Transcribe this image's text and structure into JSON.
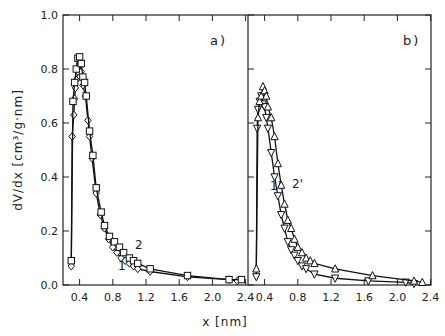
{
  "chart_data": [
    {
      "panel": "a)",
      "type": "line",
      "title": "",
      "xlabel": "x [nm]",
      "ylabel": "dV/dx [cm3/g·nm]",
      "xlim": [
        0.2,
        2.43
      ],
      "ylim": [
        0.0,
        1.0
      ],
      "xticks": [
        "0.4",
        "0.8",
        "1.2",
        "1.6",
        "2.0",
        "2.4"
      ],
      "yticks": [
        "0.0",
        "0.2",
        "0.4",
        "0.6",
        "0.8",
        "1.0"
      ],
      "grid": false,
      "series": [
        {
          "name": "1",
          "marker": "diamond",
          "x": [
            0.3,
            0.31,
            0.33,
            0.34,
            0.35,
            0.36,
            0.38,
            0.4,
            0.42,
            0.44,
            0.47,
            0.5,
            0.52,
            0.55,
            0.6,
            0.65,
            0.7,
            0.75,
            0.8,
            0.85,
            0.9,
            0.95,
            1.0,
            1.05,
            1.1,
            1.25,
            1.7,
            2.2,
            2.3
          ],
          "y": [
            0.07,
            0.55,
            0.63,
            0.69,
            0.73,
            0.76,
            0.79,
            0.82,
            0.79,
            0.74,
            0.7,
            0.61,
            0.55,
            0.47,
            0.34,
            0.26,
            0.21,
            0.17,
            0.14,
            0.12,
            0.1,
            0.09,
            0.08,
            0.07,
            0.06,
            0.05,
            0.03,
            0.02,
            0.015
          ]
        },
        {
          "name": "2",
          "marker": "square",
          "x": [
            0.3,
            0.32,
            0.34,
            0.36,
            0.38,
            0.4,
            0.42,
            0.44,
            0.46,
            0.48,
            0.52,
            0.56,
            0.6,
            0.66,
            0.7,
            0.76,
            0.82,
            0.88,
            0.93,
            1.0,
            1.05,
            1.1,
            1.25,
            1.7,
            2.2,
            2.35
          ],
          "y": [
            0.09,
            0.68,
            0.75,
            0.8,
            0.84,
            0.845,
            0.82,
            0.77,
            0.75,
            0.7,
            0.57,
            0.48,
            0.36,
            0.27,
            0.22,
            0.18,
            0.16,
            0.14,
            0.12,
            0.1,
            0.09,
            0.08,
            0.06,
            0.035,
            0.02,
            0.02
          ]
        }
      ],
      "annotations": [
        {
          "text": "1",
          "x": 0.93,
          "y": 0.03
        },
        {
          "text": "2",
          "x": 1.0,
          "y": 0.13
        },
        {
          "text": "a)",
          "position": "top-right"
        }
      ]
    },
    {
      "panel": "b)",
      "type": "line",
      "title": "",
      "xlabel": "x [nm]",
      "ylabel": "dV/dx [cm3/g·nm]",
      "xlim": [
        0.2,
        2.43
      ],
      "ylim": [
        0.0,
        1.0
      ],
      "xticks": [
        "0.4",
        "0.8",
        "1.2",
        "1.6",
        "2.0",
        "2.4"
      ],
      "yticks": [
        "0.0",
        "0.2",
        "0.4",
        "0.6",
        "0.8",
        "1.0"
      ],
      "grid": false,
      "series": [
        {
          "name": "1'",
          "marker": "triangle-down",
          "x": [
            0.3,
            0.31,
            0.32,
            0.34,
            0.36,
            0.38,
            0.4,
            0.42,
            0.44,
            0.48,
            0.52,
            0.56,
            0.6,
            0.64,
            0.68,
            0.72,
            0.76,
            0.8,
            0.85,
            0.9,
            1.0,
            1.25,
            1.65,
            2.1,
            2.2
          ],
          "y": [
            0.03,
            0.58,
            0.65,
            0.68,
            0.7,
            0.67,
            0.66,
            0.62,
            0.58,
            0.49,
            0.4,
            0.33,
            0.26,
            0.21,
            0.16,
            0.13,
            0.11,
            0.09,
            0.07,
            0.06,
            0.04,
            0.025,
            0.015,
            0.01,
            0.005
          ]
        },
        {
          "name": "2'",
          "marker": "triangle-up",
          "x": [
            0.3,
            0.32,
            0.34,
            0.36,
            0.38,
            0.4,
            0.42,
            0.44,
            0.48,
            0.52,
            0.56,
            0.6,
            0.64,
            0.68,
            0.72,
            0.76,
            0.8,
            0.85,
            0.9,
            0.95,
            1.0,
            1.25,
            1.7,
            2.2,
            2.3
          ],
          "y": [
            0.06,
            0.62,
            0.68,
            0.7,
            0.735,
            0.72,
            0.7,
            0.66,
            0.62,
            0.55,
            0.45,
            0.37,
            0.3,
            0.24,
            0.21,
            0.17,
            0.14,
            0.12,
            0.1,
            0.09,
            0.08,
            0.06,
            0.035,
            0.015,
            0.01
          ]
        }
      ],
      "annotations": [
        {
          "text": "1'",
          "x": 0.48,
          "y": 0.24
        },
        {
          "text": "2'",
          "x": 0.56,
          "y": 0.25
        },
        {
          "text": "b)",
          "position": "top-right"
        }
      ]
    }
  ],
  "labels": {
    "y_axis_title": "dV/dx  [cm³/g·nm]",
    "x_axis_title": "x [nm]",
    "panel_a": "a)",
    "panel_b": "b)",
    "curve_1": "1",
    "curve_2": "2",
    "curve_1p": "1'",
    "curve_2p": "2'"
  }
}
